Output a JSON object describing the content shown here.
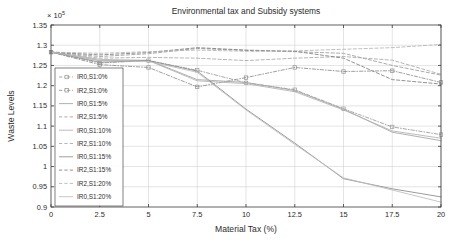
{
  "chart_data": {
    "type": "line",
    "title": "Environmental tax and Subsidy systems",
    "xlabel": "Material Tax (%)",
    "ylabel": "Waste Levels",
    "y_exponent_label": "× 10",
    "y_exponent_power": "5",
    "xlim": [
      0,
      20
    ],
    "ylim": [
      0.9,
      1.35
    ],
    "grid": true,
    "legend_position": "left-middle",
    "xticks": [
      "0",
      "2.5",
      "5",
      "7.5",
      "10",
      "12.5",
      "15",
      "17.5",
      "20"
    ],
    "xtick_values": [
      0,
      2.5,
      5,
      7.5,
      10,
      12.5,
      15,
      17.5,
      20
    ],
    "yticks": [
      "0.9",
      "0.95",
      "1",
      "1.05",
      "1.1",
      "1.15",
      "1.2",
      "1.25",
      "1.3",
      "1.35"
    ],
    "ytick_values": [
      0.9,
      0.95,
      1.0,
      1.05,
      1.1,
      1.15,
      1.2,
      1.25,
      1.3,
      1.35
    ],
    "x": [
      0,
      2.5,
      5,
      7.5,
      10,
      12.5,
      15,
      17.5,
      20
    ],
    "series": [
      {
        "name": "IR0,S1:0%",
        "style": "dashdot",
        "marker": "square",
        "color": "#9a9a9a",
        "values": [
          1.283,
          1.256,
          1.262,
          1.238,
          1.207,
          1.19,
          1.143,
          1.098,
          1.079
        ]
      },
      {
        "name": "IR2,S1:0%",
        "style": "dashdot",
        "marker": "square",
        "color": "#8e8e8e",
        "values": [
          1.283,
          1.252,
          1.245,
          1.197,
          1.22,
          1.245,
          1.235,
          1.237,
          1.208
        ]
      },
      {
        "name": "IR0,S1:5%",
        "style": "solid",
        "marker": "none",
        "color": "#a3a3a3",
        "values": [
          1.283,
          1.262,
          1.263,
          1.215,
          1.208,
          1.188,
          1.142,
          1.085,
          1.064
        ]
      },
      {
        "name": "IR2,S1:5%",
        "style": "dashed",
        "marker": "none",
        "color": "#9c9c9c",
        "values": [
          1.283,
          1.272,
          1.279,
          1.292,
          1.287,
          1.284,
          1.28,
          1.25,
          1.226
        ]
      },
      {
        "name": "IR0,S1:10%",
        "style": "solid",
        "marker": "none",
        "color": "#b0b0b0",
        "values": [
          1.283,
          1.265,
          1.262,
          1.212,
          1.205,
          1.185,
          1.14,
          1.088,
          1.07
        ]
      },
      {
        "name": "IR2,S1:10%",
        "style": "dashed",
        "marker": "none",
        "color": "#a8a8a8",
        "values": [
          1.283,
          1.268,
          1.27,
          1.268,
          1.262,
          1.268,
          1.272,
          1.263,
          1.228
        ]
      },
      {
        "name": "IR0,S1:15%",
        "style": "solid",
        "marker": "none",
        "color": "#8a8a8a",
        "values": [
          1.283,
          1.258,
          1.262,
          1.236,
          1.142,
          1.058,
          0.97,
          0.945,
          0.925
        ]
      },
      {
        "name": "IR2,S1:15%",
        "style": "dashed",
        "marker": "none",
        "color": "#7e7e7e",
        "values": [
          1.283,
          1.276,
          1.282,
          1.294,
          1.288,
          1.285,
          1.268,
          1.215,
          1.204
        ]
      },
      {
        "name": "IR2,S1:20%",
        "style": "dashed",
        "marker": "none",
        "color": "#b4b4b4",
        "values": [
          1.283,
          1.28,
          1.284,
          1.288,
          1.285,
          1.286,
          1.29,
          1.294,
          1.302
        ]
      },
      {
        "name": "IR0,S1:20%",
        "style": "solid",
        "marker": "none",
        "color": "#bcbcbc",
        "values": [
          1.283,
          1.262,
          1.26,
          1.233,
          1.14,
          1.055,
          0.972,
          0.942,
          0.912
        ]
      }
    ]
  }
}
